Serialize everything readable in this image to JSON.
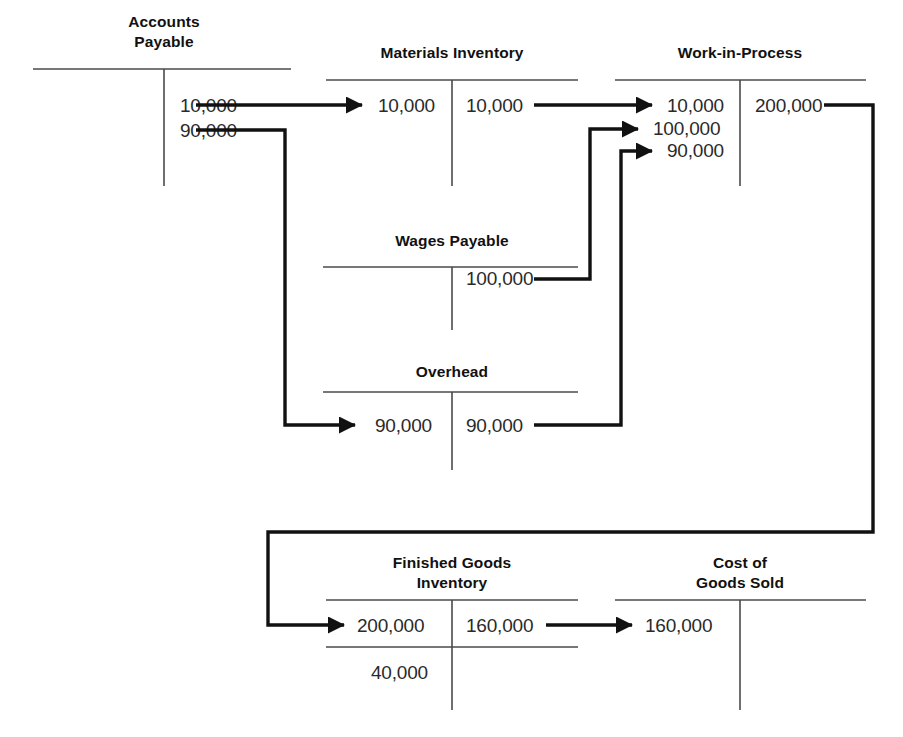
{
  "figure": {
    "kind": "t-account-flow-diagram",
    "title_visible": false,
    "background_color": "#ffffff",
    "line_color": "#111111",
    "rule_color": "#4a4a4a",
    "text_color": "#2a2a2a"
  },
  "accounts": [
    {
      "id": "accounts-payable",
      "name": "Accounts\nPayable",
      "title_line1": "Accounts",
      "title_line2": "Payable",
      "debits": [],
      "credits": [
        "10,000",
        "90,000"
      ],
      "balance": null
    },
    {
      "id": "materials-inventory",
      "name": "Materials Inventory",
      "title_line1": "Materials Inventory",
      "title_line2": "",
      "debits": [
        "10,000"
      ],
      "credits": [
        "10,000"
      ],
      "balance": null
    },
    {
      "id": "work-in-process",
      "name": "Work-in-Process",
      "title_line1": "Work-in-Process",
      "title_line2": "",
      "debits": [
        "10,000",
        "100,000",
        "90,000"
      ],
      "credits": [
        "200,000"
      ],
      "balance": null
    },
    {
      "id": "wages-payable",
      "name": "Wages Payable",
      "title_line1": "Wages Payable",
      "title_line2": "",
      "debits": [],
      "credits": [
        "100,000"
      ],
      "balance": null
    },
    {
      "id": "overhead",
      "name": "Overhead",
      "title_line1": "Overhead",
      "title_line2": "",
      "debits": [
        "90,000"
      ],
      "credits": [
        "90,000"
      ],
      "balance": null
    },
    {
      "id": "finished-goods-inventory",
      "name": "Finished Goods Inventory",
      "title_line1": "Finished Goods",
      "title_line2": "Inventory",
      "debits": [
        "200,000"
      ],
      "credits": [
        "160,000"
      ],
      "balance": "40,000"
    },
    {
      "id": "cost-of-goods-sold",
      "name": "Cost of Goods Sold",
      "title_line1": "Cost of",
      "title_line2": "Goods Sold",
      "debits": [
        "160,000"
      ],
      "credits": [],
      "balance": null
    }
  ],
  "labels": {
    "ap_title_1": "Accounts",
    "ap_title_2": "Payable",
    "mi_title": "Materials Inventory",
    "wip_title": "Work-in-Process",
    "wp_title": "Wages Payable",
    "oh_title": "Overhead",
    "fg_title_1": "Finished Goods",
    "fg_title_2": "Inventory",
    "cogs_title_1": "Cost of",
    "cogs_title_2": "Goods Sold",
    "ap_cr_1": "10,000",
    "ap_cr_2": "90,000",
    "mi_dr_1": "10,000",
    "mi_cr_1": "10,000",
    "wip_dr_1": "10,000",
    "wip_dr_2": "100,000",
    "wip_dr_3": "90,000",
    "wip_cr_1": "200,000",
    "wp_cr_1": "100,000",
    "oh_dr_1": "90,000",
    "oh_cr_1": "90,000",
    "fg_dr_1": "200,000",
    "fg_cr_1": "160,000",
    "fg_balance": "40,000",
    "cogs_dr_1": "160,000"
  },
  "flows": [
    {
      "id": "ap-to-materials",
      "amount": "10,000",
      "from": "accounts-payable",
      "to": "materials-inventory"
    },
    {
      "id": "ap-to-overhead",
      "amount": "90,000",
      "from": "accounts-payable",
      "to": "overhead"
    },
    {
      "id": "materials-to-wip",
      "amount": "10,000",
      "from": "materials-inventory",
      "to": "work-in-process"
    },
    {
      "id": "wages-to-wip",
      "amount": "100,000",
      "from": "wages-payable",
      "to": "work-in-process"
    },
    {
      "id": "overhead-to-wip",
      "amount": "90,000",
      "from": "overhead",
      "to": "work-in-process"
    },
    {
      "id": "wip-to-finished-goods",
      "amount": "200,000",
      "from": "work-in-process",
      "to": "finished-goods-inventory"
    },
    {
      "id": "finished-goods-to-cogs",
      "amount": "160,000",
      "from": "finished-goods-inventory",
      "to": "cost-of-goods-sold"
    }
  ]
}
